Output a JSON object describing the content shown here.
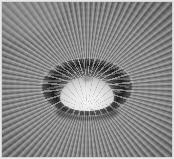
{
  "image": {
    "kind": "photograph",
    "title": "Domed ceiling interior, upward fisheye view",
    "subject": "dome-interior",
    "orientation": "landscape",
    "color_mode": "grayscale",
    "width_px": 174,
    "height_px": 159,
    "alt_text": "Black and white upward view of a ribbed domed ceiling radiating from a central drum of dark arched windows surrounding a bright white cupola."
  },
  "composition": {
    "center_x_pct": 50,
    "center_y_pct": 55,
    "rib_count": 100,
    "arch_count": 32,
    "cupola_rib_count": 28
  },
  "regions": [
    {
      "name": "ceiling-ribs",
      "label": "Radiating ribbed ceiling",
      "description": "Dense radial spokes of alternating light and dark fanning out to all four corners"
    },
    {
      "name": "drum-ring",
      "label": "Dark arched drum",
      "description": "Ellipse of deeply shadowed arched openings encircling the cupola"
    },
    {
      "name": "cupola",
      "label": "Central white cupola",
      "description": "Bright overexposed dome with vertical meridian ribs"
    },
    {
      "name": "print-border",
      "label": "Light photographic border",
      "description": "Thin pale margin framing the image on all four sides"
    }
  ],
  "palette": {
    "border": "#d2d2d2",
    "ceiling_mid": "#969696",
    "ceiling_dark": "#6e6e6e",
    "ceiling_light": "#bdbdbd",
    "drum_shadow": "#1a1a1a",
    "cupola_highlight": "#f4f4f4",
    "cupola_mid": "#d6d6d6",
    "vignette": "#000000"
  }
}
